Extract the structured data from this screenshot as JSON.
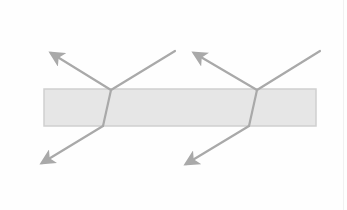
{
  "diagram": {
    "type": "refraction-through-slab",
    "canvas": {
      "width": 347,
      "height": 210,
      "background": "#fefefe"
    },
    "colors": {
      "slab_fill": "#e6e6e6",
      "slab_stroke": "#cfcfcf",
      "ray": "#a9a9a9",
      "arrowhead": "#a9a9a9"
    },
    "slab": {
      "x": 44,
      "y": 89,
      "width": 272,
      "height": 37
    },
    "ray_groups": [
      {
        "name": "left",
        "incident": {
          "from": [
            175,
            51
          ],
          "to": [
            111,
            90
          ]
        },
        "reflected": {
          "from": [
            111,
            90
          ],
          "to": [
            51,
            53
          ]
        },
        "refracted_inside": {
          "from": [
            111,
            90
          ],
          "to": [
            103,
            126
          ]
        },
        "emergent": {
          "from": [
            103,
            126
          ],
          "to": [
            42,
            163
          ]
        }
      },
      {
        "name": "right",
        "incident": {
          "from": [
            320,
            51
          ],
          "to": [
            257,
            90
          ]
        },
        "reflected": {
          "from": [
            257,
            90
          ],
          "to": [
            194,
            53
          ]
        },
        "refracted_inside": {
          "from": [
            257,
            90
          ],
          "to": [
            249,
            126
          ]
        },
        "emergent": {
          "from": [
            249,
            126
          ],
          "to": [
            186,
            164
          ]
        }
      }
    ]
  }
}
